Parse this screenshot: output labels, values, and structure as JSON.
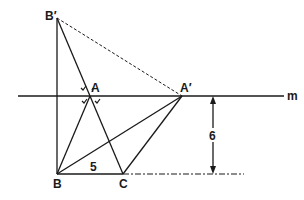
{
  "diagram": {
    "points": {
      "B_prime": {
        "label": "B′",
        "x": 57,
        "y": 18
      },
      "A": {
        "label": "A",
        "x": 90,
        "y": 96
      },
      "A_prime": {
        "label": "A′",
        "x": 182,
        "y": 96
      },
      "B": {
        "label": "B",
        "x": 57,
        "y": 174
      },
      "C": {
        "label": "C",
        "x": 123,
        "y": 174
      }
    },
    "line_m": {
      "label": "m",
      "x1": 18,
      "x2": 284,
      "y": 96
    },
    "measurements": {
      "BC": {
        "label": "5"
      },
      "height": {
        "label": "6"
      }
    },
    "colors": {
      "stroke": "#1a1a1a",
      "background": "#ffffff"
    }
  }
}
